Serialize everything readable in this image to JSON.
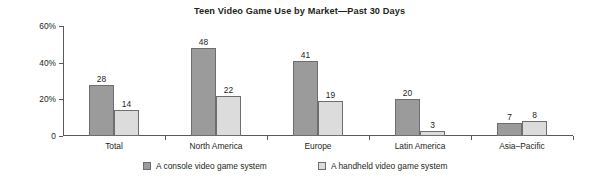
{
  "chart_data": {
    "type": "bar",
    "title": "Teen Video Game Use by Market—Past 30 Days",
    "xlabel": "",
    "ylabel": "",
    "ylim": [
      0,
      60
    ],
    "grid": false,
    "legend_position": "bottom",
    "y_ticks": [
      {
        "value": 0,
        "label": "0"
      },
      {
        "value": 20,
        "label": "20%"
      },
      {
        "value": 40,
        "label": "40%"
      },
      {
        "value": 60,
        "label": "60%"
      }
    ],
    "categories": [
      "Total",
      "North America",
      "Europe",
      "Latin America",
      "Asia–Pacific"
    ],
    "series": [
      {
        "name": "A console video game system",
        "color": "#9b9b9b",
        "values": [
          28,
          48,
          41,
          20,
          7
        ],
        "labels": [
          "28",
          "48",
          "41",
          "20",
          "7"
        ]
      },
      {
        "name": "A handheld video game system",
        "color": "#dcdcdc",
        "values": [
          14,
          22,
          19,
          3,
          8
        ],
        "labels": [
          "14",
          "22",
          "19",
          "3",
          "8"
        ]
      }
    ]
  },
  "colors": {
    "axis": "#58595b",
    "bar_outline": "#6d6e71",
    "text": "#231f20",
    "background": "#ffffff"
  }
}
